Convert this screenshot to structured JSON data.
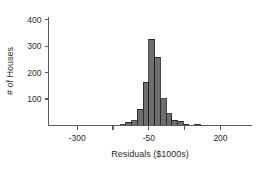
{
  "chart_data": {
    "type": "bar",
    "title": "",
    "subtitle": "",
    "xlabel": "Residuals ($1000s)",
    "ylabel": "# of Houses",
    "xlim": [
      -400,
      310
    ],
    "ylim": [
      0,
      410
    ],
    "x_ticks": [
      -300,
      -50,
      200
    ],
    "x_tick_labels": [
      "-300",
      "-50",
      "200"
    ],
    "x_minor_ticks": [
      -425,
      -300,
      -175,
      -50,
      75,
      200,
      325
    ],
    "y_ticks": [
      100,
      200,
      300,
      400
    ],
    "y_tick_labels": [
      "100",
      "200",
      "300",
      "400"
    ],
    "grid": false,
    "legend": false,
    "bin_width": 20,
    "bar_color": "#6e6e6e",
    "bar_edge_color": "#1c1c1c",
    "axis_color": "#5b5b5b",
    "text_color": "#2b2b2b",
    "bins": [
      {
        "x_left": -150,
        "x_right": -130,
        "value": 3
      },
      {
        "x_left": -130,
        "x_right": -110,
        "value": 12
      },
      {
        "x_left": -110,
        "x_right": -90,
        "value": 18
      },
      {
        "x_left": -90,
        "x_right": -70,
        "value": 62
      },
      {
        "x_left": -70,
        "x_right": -50,
        "value": 163
      },
      {
        "x_left": -50,
        "x_right": -30,
        "value": 325
      },
      {
        "x_left": -30,
        "x_right": -10,
        "value": 258
      },
      {
        "x_left": -10,
        "x_right": 10,
        "value": 102
      },
      {
        "x_left": 10,
        "x_right": 30,
        "value": 45
      },
      {
        "x_left": 30,
        "x_right": 50,
        "value": 20
      },
      {
        "x_left": 50,
        "x_right": 70,
        "value": 16
      },
      {
        "x_left": 70,
        "x_right": 90,
        "value": 4
      },
      {
        "x_left": 110,
        "x_right": 130,
        "value": 5
      }
    ],
    "categories": [
      "-140",
      "-120",
      "-100",
      "-80",
      "-60",
      "-40",
      "-20",
      "0",
      "20",
      "40",
      "60",
      "80",
      "120"
    ],
    "values": [
      3,
      12,
      18,
      62,
      163,
      325,
      258,
      102,
      45,
      20,
      16,
      4,
      5
    ]
  }
}
